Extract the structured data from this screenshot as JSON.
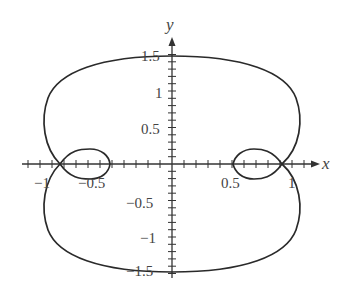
{
  "chart_data": {
    "type": "line",
    "title": "",
    "xlabel": "x",
    "ylabel": "y",
    "xlim": [
      -1.25,
      1.25
    ],
    "ylim": [
      -1.55,
      1.75
    ],
    "grid": false,
    "legend": null,
    "x_ticks": {
      "major": [
        -1,
        -0.5,
        0.5,
        1
      ],
      "minor_step": 0.1
    },
    "y_ticks": {
      "major": [
        -1.5,
        -1,
        -0.5,
        0.5,
        1,
        1.5
      ],
      "minor_step": 0.1
    },
    "x_tick_labels": [
      "−1",
      "−0.5",
      "0.5",
      "1"
    ],
    "y_tick_labels": [
      "1.5",
      "1",
      "0.5",
      "−0.5",
      "−1",
      "−1.5"
    ],
    "series": [
      {
        "name": "closed curve (symmetric about both axes)",
        "description": "Outer lobe through (0,1.5), (±1.05,±0.5), (0,-1.5) self-intersecting on the x-axis at about x=±0.93, with small inner loops between x=±0.5 and x=±0.93 reaching y≈±0.2",
        "points": [
          [
            0.0,
            1.5
          ],
          [
            0.4,
            1.45
          ],
          [
            0.75,
            1.25
          ],
          [
            0.95,
            0.95
          ],
          [
            1.04,
            0.55
          ],
          [
            1.0,
            0.25
          ],
          [
            0.92,
            0.0
          ],
          [
            0.75,
            0.18
          ],
          [
            0.58,
            0.12
          ],
          [
            0.5,
            0.0
          ],
          [
            0.58,
            -0.12
          ],
          [
            0.75,
            -0.18
          ],
          [
            0.92,
            0.0
          ],
          [
            1.0,
            -0.25
          ],
          [
            1.04,
            -0.55
          ],
          [
            0.95,
            -0.95
          ],
          [
            0.75,
            -1.25
          ],
          [
            0.4,
            -1.45
          ],
          [
            0.0,
            -1.5
          ],
          [
            -0.4,
            -1.45
          ],
          [
            -0.75,
            -1.25
          ],
          [
            -0.95,
            -0.95
          ],
          [
            -1.05,
            -0.55
          ],
          [
            -1.0,
            -0.25
          ],
          [
            -0.93,
            0.0
          ],
          [
            -0.75,
            -0.18
          ],
          [
            -0.58,
            -0.12
          ],
          [
            -0.5,
            0.0
          ],
          [
            -0.58,
            0.12
          ],
          [
            -0.75,
            0.18
          ],
          [
            -0.93,
            0.0
          ],
          [
            -1.0,
            0.25
          ],
          [
            -1.05,
            0.55
          ],
          [
            -0.95,
            0.95
          ],
          [
            -0.75,
            1.25
          ],
          [
            -0.4,
            1.45
          ],
          [
            0.0,
            1.5
          ]
        ]
      }
    ]
  }
}
